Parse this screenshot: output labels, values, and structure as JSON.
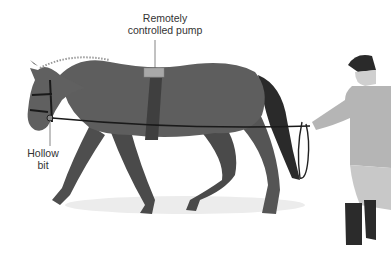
{
  "diagram": {
    "labels": {
      "pump_line1": "Remotely",
      "pump_line2": "controlled pump",
      "bit_line1": "Hollow",
      "bit_line2": "bit"
    },
    "colors": {
      "horse_body": "#5e5e5e",
      "horse_dark": "#2a2a2a",
      "pump": "#a8a8a8",
      "girth": "#3f3f3f",
      "handler_jacket": "#b5b5b5",
      "handler_breeches": "#c8c8c8",
      "boots": "#2b2b2b",
      "shadow": "#e6e6e6"
    }
  }
}
